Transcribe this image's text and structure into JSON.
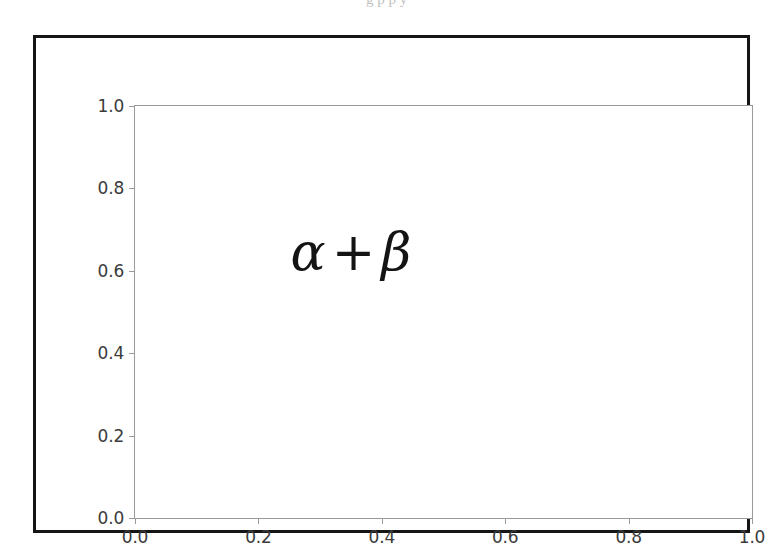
{
  "page": {
    "top_bleed_text": "g p p y"
  },
  "figure": {
    "frame_color": "#151515",
    "background_color": "#ffffff",
    "spine_color": "#9a9a9a",
    "tick_label_color": "#3b3b3b",
    "annotation_color": "#141414"
  },
  "chart_data": {
    "type": "scatter",
    "title": "",
    "xlabel": "",
    "ylabel": "",
    "xlim": [
      0.0,
      1.0
    ],
    "ylim": [
      0.0,
      1.0
    ],
    "grid": false,
    "legend": null,
    "series": [],
    "xticks": [
      {
        "value": 0.0,
        "label": "0.0"
      },
      {
        "value": 0.2,
        "label": "0.2"
      },
      {
        "value": 0.4,
        "label": "0.4"
      },
      {
        "value": 0.6,
        "label": "0.6"
      },
      {
        "value": 0.8,
        "label": "0.8"
      },
      {
        "value": 1.0,
        "label": "1.0"
      }
    ],
    "yticks": [
      {
        "value": 0.0,
        "label": "0.0"
      },
      {
        "value": 0.2,
        "label": "0.2"
      },
      {
        "value": 0.4,
        "label": "0.4"
      },
      {
        "value": 0.6,
        "label": "0.6"
      },
      {
        "value": 0.8,
        "label": "0.8"
      },
      {
        "value": 1.0,
        "label": "1.0"
      }
    ],
    "annotations": [
      {
        "text": "α + β",
        "alpha": "α",
        "operator": "+",
        "beta": "β",
        "x": 0.35,
        "y": 0.645
      }
    ]
  }
}
